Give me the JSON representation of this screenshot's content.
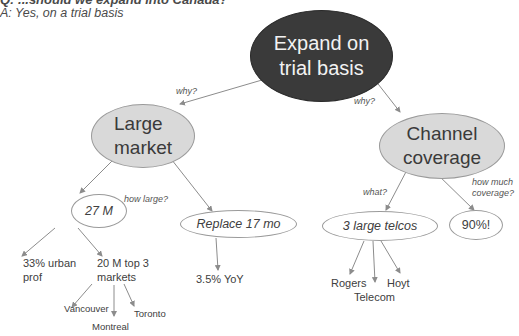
{
  "header": {
    "question_partial": "Q: ...should we expand into Canada?",
    "answer": "A: Yes, on a trial basis"
  },
  "colors": {
    "root_fill": "#3a3a3a",
    "branch_fill": "#d9d9d9",
    "leaf_fill": "#ffffff",
    "edge": "#8c8c8c",
    "text": "#404040"
  },
  "root": {
    "label_line1": "Expand on",
    "label_line2": "trial basis"
  },
  "branches": [
    {
      "edge_label": "why?",
      "label_line1": "Large",
      "label_line2": "market",
      "children": [
        {
          "edge_label": "how large?",
          "label": "27 M",
          "children": [
            {
              "label_line1": "33% urban",
              "label_line2": "prof"
            },
            {
              "label_line1": "20 M top 3",
              "label_line2": "markets",
              "children": [
                {
                  "label": "Vancouver"
                },
                {
                  "label": "Montreal"
                },
                {
                  "label": "Toronto"
                }
              ]
            }
          ]
        },
        {
          "label": "Replace 17 mo",
          "children": [
            {
              "label": "3.5% YoY"
            }
          ]
        }
      ]
    },
    {
      "edge_label": "why?",
      "label_line1": "Channel",
      "label_line2": "coverage",
      "children": [
        {
          "edge_label": "what?",
          "label": "3 large telcos",
          "children": [
            {
              "label": "Rogers"
            },
            {
              "label": "Telecom"
            },
            {
              "label": "Hoyt"
            }
          ]
        },
        {
          "edge_label_line1": "how much",
          "edge_label_line2": "coverage?",
          "label": "90%!"
        }
      ]
    }
  ]
}
